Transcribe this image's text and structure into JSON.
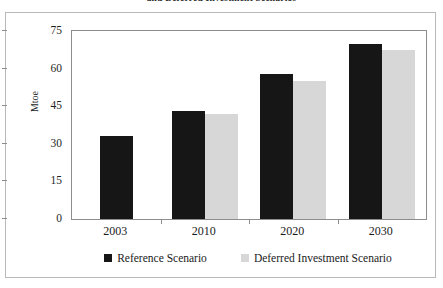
{
  "chart_data": {
    "type": "bar",
    "title": "and Deferred Investment Scenarios",
    "xlabel": "",
    "ylabel": "Mtoe",
    "categories": [
      "2003",
      "2010",
      "2020",
      "2030"
    ],
    "series": [
      {
        "name": "Reference Scenario",
        "color": "#161616",
        "values": [
          33,
          43,
          58,
          70
        ]
      },
      {
        "name": "Deferred Investment Scenario",
        "color": "#d7d7d7",
        "values": [
          null,
          42,
          55,
          67.5
        ]
      }
    ],
    "ylim": [
      0,
      75
    ],
    "yticks": [
      "0",
      "15",
      "30",
      "45",
      "60",
      "75"
    ],
    "grid": false,
    "legend_position": "bottom"
  },
  "legend": {
    "items": [
      {
        "label": "Reference Scenario",
        "swatch": "reference-swatch"
      },
      {
        "label": "Deferred Investment Scenario",
        "swatch": "deferred-swatch"
      }
    ]
  }
}
